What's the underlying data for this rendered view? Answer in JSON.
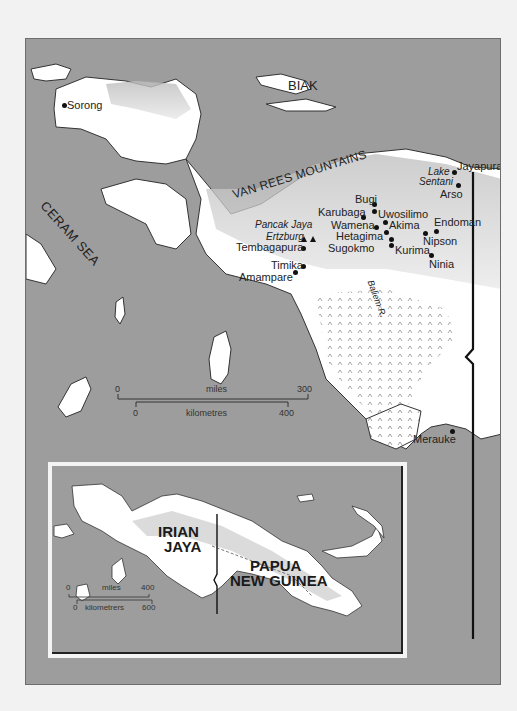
{
  "main_map": {
    "sea_labels": {
      "ceram_sea": "CERAM SEA"
    },
    "island_labels": {
      "biak": "BIAK"
    },
    "range_labels": {
      "van_rees": "VAN REES MOUNTAINS"
    },
    "lake_labels": {
      "lake": "Lake",
      "sentani": "Sentani"
    },
    "peak_labels": {
      "pancak_jaya": "Pancak Jaya",
      "ertzburg": "Ertzburg"
    },
    "river_labels": {
      "baliem": "Baliem R."
    },
    "towns": [
      {
        "name": "Sorong"
      },
      {
        "name": "Jayapura"
      },
      {
        "name": "Arso"
      },
      {
        "name": "Bugi"
      },
      {
        "name": "Karubaga"
      },
      {
        "name": "Uwosilimo"
      },
      {
        "name": "Wamena"
      },
      {
        "name": "Akima"
      },
      {
        "name": "Hetagima"
      },
      {
        "name": "Sugokmo"
      },
      {
        "name": "Kurima"
      },
      {
        "name": "Endoman"
      },
      {
        "name": "Nipson"
      },
      {
        "name": "Ninia"
      },
      {
        "name": "Tembagapura"
      },
      {
        "name": "Timika"
      },
      {
        "name": "Amampare"
      },
      {
        "name": "Merauke"
      }
    ],
    "scale": {
      "miles_label": "miles",
      "miles_start": "0",
      "miles_end": "300",
      "km_label": "kilometres",
      "km_start": "0",
      "km_end": "400"
    }
  },
  "inset_map": {
    "regions": {
      "irian_jaya_1": "IRIAN",
      "irian_jaya_2": "JAYA",
      "png_1": "PAPUA",
      "png_2": "NEW GUINEA"
    },
    "scale": {
      "miles_label": "miles",
      "miles_start": "0",
      "miles_end": "400",
      "km_label": "kilometrers",
      "km_start": "0",
      "km_end": "600"
    }
  },
  "colors": {
    "sea": "#9d9d9d",
    "land": "#ffffff",
    "relief": "#c8c8c8",
    "border": "#111111",
    "page": "#f2f2f2"
  }
}
